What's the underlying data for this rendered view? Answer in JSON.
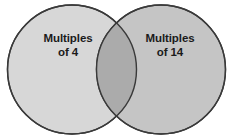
{
  "diagram": {
    "type": "venn-two-set",
    "title": "",
    "background_color": "#ffffff",
    "outline_color": "#3a3a3a",
    "outline_width": 1.4,
    "canvas": {
      "width": 233,
      "height": 139
    },
    "sets": [
      {
        "id": "left",
        "label_line_1": "Multiples",
        "label_line_2": "of 4",
        "fill_color": "#d7d7d7",
        "center_x": 72,
        "center_y": 69.5,
        "radius": 64.5
      },
      {
        "id": "right",
        "label_line_1": "Multiples",
        "label_line_2": "of 14",
        "fill_color": "#c5c5c5",
        "center_x": 161,
        "center_y": 69.5,
        "radius": 64.5
      }
    ],
    "intersection": {
      "fill_color": "#ababab",
      "label": ""
    }
  }
}
